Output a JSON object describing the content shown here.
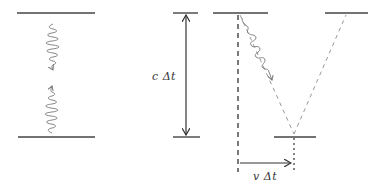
{
  "diagram": {
    "panels": [
      {
        "id": "clock-at-rest",
        "description": "Two horizontal mirrors with a photon wave packet traveling down and back up"
      },
      {
        "id": "clock-height",
        "description": "Mirror separation marked with a double-headed arrow"
      },
      {
        "id": "clock-moving",
        "description": "Moving light clock with photon traveling diagonally along a V-shaped dashed path"
      }
    ],
    "labels": {
      "height": "c Δt",
      "displacement": "v Δt"
    },
    "colors": {
      "mirror": "#444444",
      "arrow": "#333333",
      "wave": "#777777",
      "path": "#999999"
    }
  }
}
